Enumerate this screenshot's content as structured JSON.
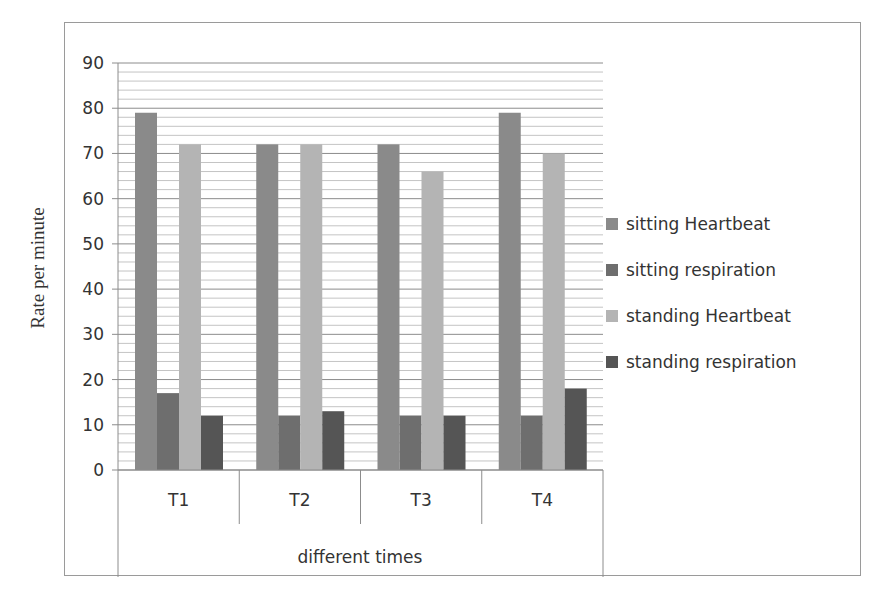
{
  "chart_data": {
    "type": "bar",
    "title": "",
    "xlabel": "different times",
    "ylabel": "Rate per minute",
    "categories": [
      "T1",
      "T2",
      "T3",
      "T4"
    ],
    "series": [
      {
        "name": "sitting Heartbeat",
        "color": "#8a8a8a",
        "values": [
          79,
          72,
          72,
          79
        ]
      },
      {
        "name": "sitting respiration",
        "color": "#6e6e6e",
        "values": [
          17,
          12,
          12,
          12
        ]
      },
      {
        "name": "standing Heartbeat",
        "color": "#b4b4b4",
        "values": [
          72,
          72,
          66,
          70
        ]
      },
      {
        "name": "standing respiration",
        "color": "#555555",
        "values": [
          12,
          13,
          12,
          18
        ]
      }
    ],
    "ylim": [
      0,
      90
    ],
    "yticks": [
      0,
      10,
      20,
      30,
      40,
      50,
      60,
      70,
      80,
      90
    ],
    "minor_grid_step": 2,
    "grid": true,
    "legend_position": "right"
  }
}
